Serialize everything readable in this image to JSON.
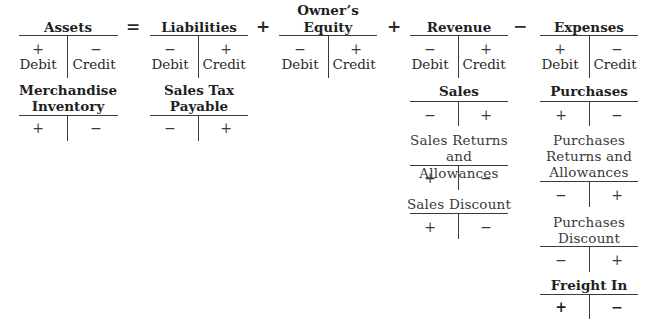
{
  "equation": {
    "operators": [
      "=",
      "+",
      "+",
      "−"
    ],
    "accounts": [
      {
        "title": "Assets",
        "left_sign": "+",
        "right_sign": "−",
        "left_label": "Debit",
        "right_label": "Credit"
      },
      {
        "title": "Liabilities",
        "left_sign": "−",
        "right_sign": "+",
        "left_label": "Debit",
        "right_label": "Credit"
      },
      {
        "title_line1": "Owner’s",
        "title_line2": "Equity",
        "left_sign": "−",
        "right_sign": "+",
        "left_label": "Debit",
        "right_label": "Credit"
      },
      {
        "title": "Revenue",
        "left_sign": "−",
        "right_sign": "+",
        "left_label": "Debit",
        "right_label": "Credit"
      },
      {
        "title": "Expenses",
        "left_sign": "+",
        "right_sign": "−",
        "left_label": "Debit",
        "right_label": "Credit"
      }
    ]
  },
  "sub_accounts": {
    "merchandise_inventory": {
      "title_line1": "Merchandise",
      "title_line2": "Inventory",
      "left_sign": "+",
      "right_sign": "−"
    },
    "sales_tax_payable": {
      "title_line1": "Sales Tax",
      "title_line2": "Payable",
      "left_sign": "−",
      "right_sign": "+"
    },
    "sales": {
      "title": "Sales",
      "left_sign": "−",
      "right_sign": "+"
    },
    "sales_returns": {
      "title_line1": "Sales Returns",
      "title_line2": "and Allowances",
      "left_sign": "+",
      "right_sign": "−"
    },
    "sales_discount": {
      "title": "Sales Discount",
      "left_sign": "+",
      "right_sign": "−"
    },
    "purchases": {
      "title": "Purchases",
      "left_sign": "+",
      "right_sign": "−"
    },
    "purchases_returns": {
      "title_line1": "Purchases",
      "title_line2": "Returns and",
      "title_line3": "Allowances",
      "left_sign": "−",
      "right_sign": "+"
    },
    "purchases_discount": {
      "title_line1": "Purchases",
      "title_line2": "Discount",
      "left_sign": "−",
      "right_sign": "+"
    },
    "freight_in": {
      "title": "Freight In",
      "left_sign": "+",
      "right_sign": "−"
    }
  }
}
